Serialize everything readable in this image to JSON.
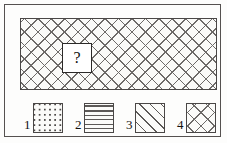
{
  "figure": {
    "type": "pattern-completion-puzzle",
    "frame_color": "#555150",
    "background_color": "#fdfdfc",
    "ink_color": "#4a4746"
  },
  "stimulus": {
    "name": "main-pattern-panel",
    "pattern": "diagonal-crosshatch",
    "pattern_description": "diamond lattice of crossing 45-degree lines",
    "border_color": "#4a4746",
    "fill_color": "#fafaf8",
    "missing_piece": {
      "label": "?",
      "name": "missing-piece-marker",
      "border_color": "#2b2928",
      "fill_color": "#ffffff"
    }
  },
  "options": {
    "title": "",
    "items": [
      {
        "number": "1",
        "pattern": "dot-grid",
        "pattern_class": "pat-dots",
        "icon": "dot-grid-icon"
      },
      {
        "number": "2",
        "pattern": "horizontal-lines",
        "pattern_class": "pat-hlines",
        "icon": "horizontal-lines-icon"
      },
      {
        "number": "3",
        "pattern": "diagonal-lines",
        "pattern_class": "pat-diag",
        "icon": "diagonal-lines-icon"
      },
      {
        "number": "4",
        "pattern": "diagonal-crosshatch",
        "pattern_class": "pat-crosshatch",
        "icon": "crosshatch-icon"
      }
    ]
  }
}
